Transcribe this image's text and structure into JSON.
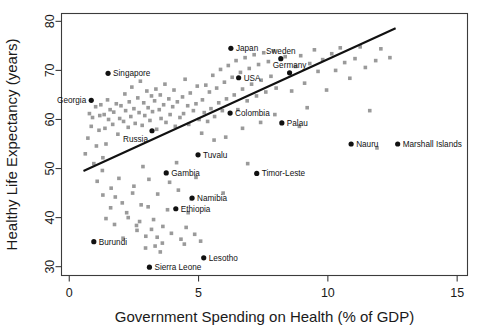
{
  "chart_data": {
    "type": "scatter",
    "title": "",
    "xlabel": "Government Spending on Health (% of GDP)",
    "ylabel": "Healthy Life Expectancy (years)",
    "xlim": [
      -0.3,
      15.4
    ],
    "ylim": [
      28.2,
      81.6
    ],
    "xticks": [
      0,
      5,
      10,
      15
    ],
    "yticks": [
      30,
      40,
      50,
      60,
      70,
      80
    ],
    "grid": false,
    "legend": null,
    "point_color": "#9a9a9a",
    "highlight_color": "#111111",
    "trendline_color": "#111111",
    "trendline": {
      "x0": 0.55,
      "y0": 49.5,
      "x1": 12.62,
      "y1": 78.6
    },
    "labeled_points": [
      {
        "label": "Singapore",
        "x": 1.5,
        "y": 69.4,
        "label_side": "right"
      },
      {
        "label": "Georgia",
        "x": 0.85,
        "y": 63.9,
        "label_side": "left"
      },
      {
        "label": "Japan",
        "x": 6.25,
        "y": 74.5,
        "label_side": "right"
      },
      {
        "label": "Sweden",
        "x": 8.18,
        "y": 72.4,
        "label_side": "above"
      },
      {
        "label": "Germany",
        "x": 8.52,
        "y": 69.5,
        "label_side": "above"
      },
      {
        "label": "USA",
        "x": 6.55,
        "y": 68.5,
        "label_side": "right"
      },
      {
        "label": "Russia",
        "x": 3.2,
        "y": 57.7,
        "label_side": "below"
      },
      {
        "label": "Colombia",
        "x": 6.22,
        "y": 61.3,
        "label_side": "right"
      },
      {
        "label": "Palau",
        "x": 8.22,
        "y": 59.3,
        "label_side": "right"
      },
      {
        "label": "Nauru",
        "x": 10.9,
        "y": 55.0,
        "label_side": "right"
      },
      {
        "label": "Marshall Islands",
        "x": 12.7,
        "y": 55.0,
        "label_side": "right"
      },
      {
        "label": "Tuvalu",
        "x": 4.98,
        "y": 52.8,
        "label_side": "right"
      },
      {
        "label": "Timor-Leste",
        "x": 7.25,
        "y": 49.0,
        "label_side": "right"
      },
      {
        "label": "Gambia",
        "x": 3.75,
        "y": 49.1,
        "label_side": "right"
      },
      {
        "label": "Namibia",
        "x": 4.75,
        "y": 44.0,
        "label_side": "right"
      },
      {
        "label": "Ethiopia",
        "x": 4.12,
        "y": 41.8,
        "label_side": "right"
      },
      {
        "label": "Burundi",
        "x": 0.95,
        "y": 35.1,
        "label_side": "right"
      },
      {
        "label": "Lesotho",
        "x": 5.2,
        "y": 31.8,
        "label_side": "right"
      },
      {
        "label": "Sierra Leone",
        "x": 3.1,
        "y": 29.9,
        "label_side": "right"
      }
    ],
    "background_points": [
      {
        "x": 0.62,
        "y": 53.0
      },
      {
        "x": 0.72,
        "y": 56.2
      },
      {
        "x": 0.78,
        "y": 61.2
      },
      {
        "x": 0.85,
        "y": 58.6
      },
      {
        "x": 0.9,
        "y": 60.4
      },
      {
        "x": 0.95,
        "y": 51.0
      },
      {
        "x": 1.02,
        "y": 62.6
      },
      {
        "x": 1.05,
        "y": 54.6
      },
      {
        "x": 1.08,
        "y": 47.4
      },
      {
        "x": 1.15,
        "y": 57.8
      },
      {
        "x": 1.18,
        "y": 60.8
      },
      {
        "x": 1.22,
        "y": 63.0
      },
      {
        "x": 1.28,
        "y": 49.6
      },
      {
        "x": 1.3,
        "y": 52.2
      },
      {
        "x": 1.35,
        "y": 61.0
      },
      {
        "x": 1.38,
        "y": 58.2
      },
      {
        "x": 1.42,
        "y": 55.0
      },
      {
        "x": 1.48,
        "y": 64.0
      },
      {
        "x": 1.52,
        "y": 60.0
      },
      {
        "x": 1.58,
        "y": 62.0
      },
      {
        "x": 1.62,
        "y": 46.0
      },
      {
        "x": 1.68,
        "y": 59.0
      },
      {
        "x": 1.72,
        "y": 61.5
      },
      {
        "x": 1.78,
        "y": 44.2
      },
      {
        "x": 1.82,
        "y": 63.2
      },
      {
        "x": 1.88,
        "y": 57.0
      },
      {
        "x": 1.92,
        "y": 48.0
      },
      {
        "x": 1.95,
        "y": 60.2
      },
      {
        "x": 2.0,
        "y": 62.8
      },
      {
        "x": 2.05,
        "y": 43.0
      },
      {
        "x": 2.1,
        "y": 59.6
      },
      {
        "x": 2.15,
        "y": 65.2
      },
      {
        "x": 2.18,
        "y": 61.8
      },
      {
        "x": 2.22,
        "y": 41.0
      },
      {
        "x": 2.28,
        "y": 58.4
      },
      {
        "x": 2.32,
        "y": 63.6
      },
      {
        "x": 2.38,
        "y": 60.6
      },
      {
        "x": 2.42,
        "y": 66.6
      },
      {
        "x": 2.45,
        "y": 45.0
      },
      {
        "x": 2.5,
        "y": 62.2
      },
      {
        "x": 2.55,
        "y": 59.2
      },
      {
        "x": 2.6,
        "y": 38.4
      },
      {
        "x": 2.65,
        "y": 64.4
      },
      {
        "x": 2.7,
        "y": 61.4
      },
      {
        "x": 2.75,
        "y": 67.8
      },
      {
        "x": 2.78,
        "y": 42.6
      },
      {
        "x": 2.82,
        "y": 58.8
      },
      {
        "x": 2.88,
        "y": 63.4
      },
      {
        "x": 2.92,
        "y": 60.8
      },
      {
        "x": 2.96,
        "y": 36.2
      },
      {
        "x": 3.0,
        "y": 65.8
      },
      {
        "x": 3.05,
        "y": 62.4
      },
      {
        "x": 3.08,
        "y": 47.8
      },
      {
        "x": 3.12,
        "y": 59.8
      },
      {
        "x": 3.18,
        "y": 64.8
      },
      {
        "x": 3.22,
        "y": 61.6
      },
      {
        "x": 3.26,
        "y": 39.6
      },
      {
        "x": 3.3,
        "y": 63.8
      },
      {
        "x": 3.35,
        "y": 66.2
      },
      {
        "x": 3.38,
        "y": 58.0
      },
      {
        "x": 3.42,
        "y": 44.8
      },
      {
        "x": 3.48,
        "y": 62.0
      },
      {
        "x": 3.52,
        "y": 65.0
      },
      {
        "x": 3.55,
        "y": 60.2
      },
      {
        "x": 3.6,
        "y": 34.8
      },
      {
        "x": 3.65,
        "y": 63.0
      },
      {
        "x": 3.7,
        "y": 67.2
      },
      {
        "x": 3.74,
        "y": 59.4
      },
      {
        "x": 3.8,
        "y": 41.6
      },
      {
        "x": 3.85,
        "y": 64.2
      },
      {
        "x": 3.9,
        "y": 61.0
      },
      {
        "x": 3.95,
        "y": 36.8
      },
      {
        "x": 4.0,
        "y": 62.6
      },
      {
        "x": 4.05,
        "y": 66.0
      },
      {
        "x": 4.1,
        "y": 58.6
      },
      {
        "x": 4.18,
        "y": 63.6
      },
      {
        "x": 4.22,
        "y": 45.6
      },
      {
        "x": 4.28,
        "y": 60.4
      },
      {
        "x": 4.32,
        "y": 35.6
      },
      {
        "x": 4.38,
        "y": 64.6
      },
      {
        "x": 4.42,
        "y": 61.2
      },
      {
        "x": 4.48,
        "y": 68.2
      },
      {
        "x": 4.52,
        "y": 38.0
      },
      {
        "x": 4.58,
        "y": 62.8
      },
      {
        "x": 4.62,
        "y": 59.0
      },
      {
        "x": 4.68,
        "y": 65.4
      },
      {
        "x": 4.72,
        "y": 43.8
      },
      {
        "x": 4.8,
        "y": 61.8
      },
      {
        "x": 4.85,
        "y": 36.6
      },
      {
        "x": 4.9,
        "y": 63.2
      },
      {
        "x": 4.95,
        "y": 66.8
      },
      {
        "x": 5.02,
        "y": 60.0
      },
      {
        "x": 5.08,
        "y": 35.2
      },
      {
        "x": 5.15,
        "y": 64.0
      },
      {
        "x": 5.22,
        "y": 61.4
      },
      {
        "x": 5.28,
        "y": 67.0
      },
      {
        "x": 5.35,
        "y": 59.6
      },
      {
        "x": 5.42,
        "y": 65.6
      },
      {
        "x": 5.48,
        "y": 62.2
      },
      {
        "x": 5.55,
        "y": 69.0
      },
      {
        "x": 5.62,
        "y": 60.6
      },
      {
        "x": 5.7,
        "y": 66.4
      },
      {
        "x": 5.78,
        "y": 63.4
      },
      {
        "x": 5.85,
        "y": 70.2
      },
      {
        "x": 5.92,
        "y": 61.8
      },
      {
        "x": 6.0,
        "y": 67.6
      },
      {
        "x": 6.08,
        "y": 64.2
      },
      {
        "x": 6.15,
        "y": 71.0
      },
      {
        "x": 6.3,
        "y": 68.6
      },
      {
        "x": 6.38,
        "y": 65.0
      },
      {
        "x": 6.45,
        "y": 72.0
      },
      {
        "x": 6.52,
        "y": 62.0
      },
      {
        "x": 6.62,
        "y": 69.6
      },
      {
        "x": 6.7,
        "y": 66.2
      },
      {
        "x": 6.8,
        "y": 72.6
      },
      {
        "x": 6.88,
        "y": 63.8
      },
      {
        "x": 6.96,
        "y": 70.4
      },
      {
        "x": 7.05,
        "y": 67.2
      },
      {
        "x": 7.15,
        "y": 73.2
      },
      {
        "x": 7.24,
        "y": 64.8
      },
      {
        "x": 7.32,
        "y": 71.2
      },
      {
        "x": 7.42,
        "y": 68.0
      },
      {
        "x": 7.52,
        "y": 73.6
      },
      {
        "x": 7.6,
        "y": 65.6
      },
      {
        "x": 7.7,
        "y": 71.8
      },
      {
        "x": 7.8,
        "y": 68.8
      },
      {
        "x": 7.9,
        "y": 74.0
      },
      {
        "x": 8.0,
        "y": 66.4
      },
      {
        "x": 8.35,
        "y": 72.8
      },
      {
        "x": 8.6,
        "y": 65.8
      },
      {
        "x": 8.75,
        "y": 70.8
      },
      {
        "x": 8.95,
        "y": 73.0
      },
      {
        "x": 9.1,
        "y": 67.4
      },
      {
        "x": 9.3,
        "y": 71.4
      },
      {
        "x": 9.48,
        "y": 74.2
      },
      {
        "x": 9.62,
        "y": 69.8
      },
      {
        "x": 9.8,
        "y": 72.2
      },
      {
        "x": 9.95,
        "y": 66.0
      },
      {
        "x": 10.15,
        "y": 73.4
      },
      {
        "x": 10.3,
        "y": 70.0
      },
      {
        "x": 10.48,
        "y": 74.6
      },
      {
        "x": 10.65,
        "y": 71.6
      },
      {
        "x": 10.85,
        "y": 68.4
      },
      {
        "x": 11.05,
        "y": 72.4
      },
      {
        "x": 11.25,
        "y": 74.8
      },
      {
        "x": 11.45,
        "y": 70.6
      },
      {
        "x": 11.62,
        "y": 61.8
      },
      {
        "x": 11.85,
        "y": 72.0
      },
      {
        "x": 12.05,
        "y": 74.4
      },
      {
        "x": 12.4,
        "y": 72.6
      },
      {
        "x": 11.9,
        "y": 54.2
      },
      {
        "x": 4.6,
        "y": 41.0
      },
      {
        "x": 3.05,
        "y": 42.2
      },
      {
        "x": 2.28,
        "y": 40.0
      },
      {
        "x": 1.75,
        "y": 38.6
      },
      {
        "x": 2.95,
        "y": 33.8
      },
      {
        "x": 3.32,
        "y": 34.2
      },
      {
        "x": 3.4,
        "y": 36.0
      },
      {
        "x": 3.52,
        "y": 33.0
      },
      {
        "x": 2.62,
        "y": 37.4
      },
      {
        "x": 1.6,
        "y": 42.0
      },
      {
        "x": 1.3,
        "y": 44.6
      },
      {
        "x": 2.08,
        "y": 35.8
      },
      {
        "x": 1.42,
        "y": 39.8
      },
      {
        "x": 2.72,
        "y": 39.2
      },
      {
        "x": 3.18,
        "y": 37.6
      },
      {
        "x": 3.62,
        "y": 38.2
      },
      {
        "x": 4.45,
        "y": 34.6
      },
      {
        "x": 2.5,
        "y": 46.4
      },
      {
        "x": 3.88,
        "y": 47.2
      },
      {
        "x": 2.85,
        "y": 50.4
      },
      {
        "x": 4.15,
        "y": 51.2
      },
      {
        "x": 4.9,
        "y": 48.2
      },
      {
        "x": 5.6,
        "y": 55.8
      },
      {
        "x": 5.12,
        "y": 57.2
      },
      {
        "x": 6.05,
        "y": 56.4
      },
      {
        "x": 6.7,
        "y": 58.2
      },
      {
        "x": 7.4,
        "y": 59.4
      },
      {
        "x": 7.95,
        "y": 61.0
      },
      {
        "x": 9.2,
        "y": 62.4
      },
      {
        "x": 8.9,
        "y": 58.6
      },
      {
        "x": 6.9,
        "y": 51.0
      },
      {
        "x": 5.95,
        "y": 45.0
      }
    ]
  },
  "axis": {
    "xlabel": "Government Spending on Health (% of GDP)",
    "ylabel": "Healthy Life Expectancy (years)",
    "xtick_labels": [
      "0",
      "5",
      "10",
      "15"
    ],
    "ytick_labels": [
      "30",
      "40",
      "50",
      "60",
      "70",
      "80"
    ]
  }
}
